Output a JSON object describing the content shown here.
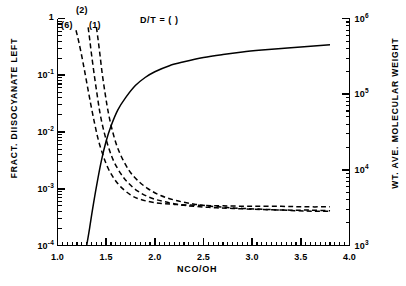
{
  "chart_data": {
    "type": "line",
    "title": "",
    "xlabel": "NCO/OH",
    "ylabel": "FRACT. DIISOCYANATE LEFT",
    "y2label": "WT. AVE. MOLECULAR WEIGHT",
    "xlim": [
      1.0,
      4.0
    ],
    "ylim": [
      0.0001,
      1
    ],
    "y2lim": [
      1000,
      1000000
    ],
    "yscale": "log",
    "y2scale": "log",
    "grid": false,
    "legend": "none",
    "annotations": [
      {
        "text": "D/T = ( )",
        "x": 1.62,
        "y": 0.8
      },
      {
        "text": "(2)",
        "x": 1.32,
        "y": 1.05
      },
      {
        "text": "(6)",
        "x": 1.2,
        "y": 0.72
      },
      {
        "text": "(1)",
        "x": 1.44,
        "y": 0.7
      }
    ],
    "xticks": [
      "1.0",
      "1.5",
      "2.0",
      "2.5",
      "3.0",
      "3.5",
      "4.0"
    ],
    "xtick_values": [
      1.0,
      1.5,
      2.0,
      2.5,
      3.0,
      3.5,
      4.0
    ],
    "yticks": [
      "1",
      "10-1",
      "10-2",
      "10-3",
      "10-4"
    ],
    "ytick_values": [
      1,
      0.1,
      0.01,
      0.001,
      0.0001
    ],
    "y2ticks": [
      "106",
      "105",
      "104",
      "103"
    ],
    "y2tick_values": [
      1000000,
      100000,
      10000,
      1000
    ],
    "series": [
      {
        "name": "wt-ave-molecular-weight",
        "style": "solid",
        "axis": "right",
        "x": [
          1.3,
          1.33,
          1.36,
          1.4,
          1.45,
          1.5,
          1.55,
          1.62,
          1.7,
          1.8,
          1.9,
          2.0,
          2.15,
          2.3,
          2.5,
          2.7,
          2.9,
          3.1,
          3.3,
          3.5,
          3.8
        ],
        "y": [
          1000,
          1700,
          3000,
          6000,
          13000,
          24000,
          38000,
          62000,
          90000,
          130000,
          166000,
          198000,
          238000,
          268000,
          305000,
          334000,
          360000,
          382000,
          402000,
          420000,
          450000
        ]
      },
      {
        "name": "fract-diisocyanate-left-6",
        "style": "dashed",
        "axis": "left",
        "label": "(6)",
        "x": [
          1.19,
          1.22,
          1.26,
          1.3,
          1.34,
          1.38,
          1.42,
          1.47,
          1.52,
          1.58,
          1.65,
          1.75,
          1.85,
          2.0,
          2.2,
          2.45,
          2.7,
          3.0,
          3.3,
          3.55,
          3.8
        ],
        "y": [
          0.62,
          0.38,
          0.175,
          0.075,
          0.032,
          0.0145,
          0.0072,
          0.0038,
          0.0023,
          0.00152,
          0.00108,
          0.00078,
          0.00065,
          0.00057,
          0.00053,
          0.00051,
          0.0005,
          0.00049,
          0.00049,
          0.00048,
          0.00048
        ]
      },
      {
        "name": "fract-diisocyanate-left-2",
        "style": "dashed",
        "axis": "left",
        "label": "(2)",
        "x": [
          1.315,
          1.33,
          1.35,
          1.38,
          1.41,
          1.44,
          1.48,
          1.53,
          1.58,
          1.65,
          1.72,
          1.82,
          1.95,
          2.1,
          2.3,
          2.55,
          2.8,
          3.1,
          3.4,
          3.6,
          3.8
        ],
        "y": [
          0.7,
          0.44,
          0.23,
          0.095,
          0.042,
          0.02,
          0.0098,
          0.005,
          0.003,
          0.00185,
          0.0013,
          0.00092,
          0.0007,
          0.00059,
          0.00051,
          0.00047,
          0.00045,
          0.00043,
          0.00042,
          0.00042,
          0.00041
        ]
      },
      {
        "name": "fract-diisocyanate-left-1",
        "style": "dashed",
        "axis": "left",
        "label": "(1)",
        "x": [
          1.4,
          1.415,
          1.435,
          1.46,
          1.49,
          1.52,
          1.56,
          1.61,
          1.67,
          1.74,
          1.82,
          1.93,
          2.06,
          2.22,
          2.42,
          2.65,
          2.9,
          3.18,
          3.45,
          3.65,
          3.8
        ],
        "y": [
          0.7,
          0.45,
          0.24,
          0.105,
          0.047,
          0.023,
          0.0112,
          0.0057,
          0.0033,
          0.00205,
          0.00142,
          0.001,
          0.00076,
          0.00062,
          0.00053,
          0.00048,
          0.00045,
          0.00043,
          0.00041,
          0.0004,
          0.0004
        ]
      }
    ]
  },
  "axes": {
    "x_title": "NCO/OH",
    "y_left_title": "FRACT. DIISOCYANATE LEFT",
    "y_right_title": "WT. AVE. MOLECULAR WEIGHT"
  },
  "ticks": {
    "x": [
      "1.0",
      "1.5",
      "2.0",
      "2.5",
      "3.0",
      "3.5",
      "4.0"
    ],
    "y_left": [
      {
        "mantissa": "1",
        "exp": ""
      },
      {
        "mantissa": "10",
        "exp": "-1"
      },
      {
        "mantissa": "10",
        "exp": "-2"
      },
      {
        "mantissa": "10",
        "exp": "-3"
      },
      {
        "mantissa": "10",
        "exp": "-4"
      }
    ],
    "y_right": [
      {
        "mantissa": "10",
        "exp": "6"
      },
      {
        "mantissa": "10",
        "exp": "5"
      },
      {
        "mantissa": "10",
        "exp": "4"
      },
      {
        "mantissa": "10",
        "exp": "3"
      }
    ]
  },
  "annotations": {
    "dt_note": "D/T = ( )",
    "curve_2": "(2)",
    "curve_6": "(6)",
    "curve_1": "(1)"
  },
  "colors": {
    "ink": "#000000",
    "background": "#ffffff"
  }
}
